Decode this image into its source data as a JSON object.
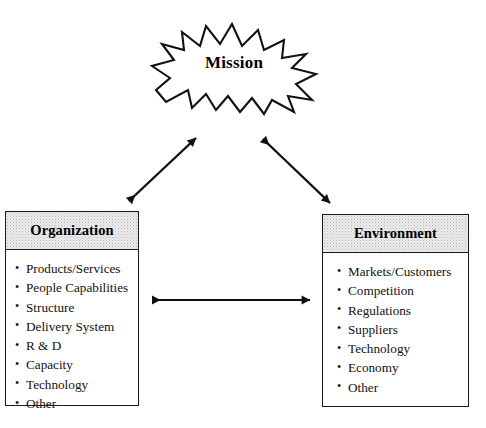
{
  "diagram": {
    "background_color": "#ffffff",
    "line_color": "#1a1a1a",
    "header_fill": "#ececec",
    "center_node": {
      "label": "Mission",
      "shape": "starburst"
    },
    "nodes": [
      {
        "id": "organization",
        "header": "Organization",
        "items": [
          "Products/Services",
          "People Capabilities",
          "Structure",
          "Delivery System",
          "R & D",
          "Capacity",
          "Technology",
          "Other"
        ]
      },
      {
        "id": "environment",
        "header": "Environment",
        "items": [
          "Markets/Customers",
          "Competition",
          "Regulations",
          "Suppliers",
          "Technology",
          "Economy",
          "Other"
        ]
      }
    ],
    "connectors": [
      {
        "id": "organization-mission",
        "name": "arrow-organization-mission",
        "style": "double-headed",
        "from": "organization",
        "to": "mission"
      },
      {
        "id": "mission-environment",
        "name": "arrow-mission-environment",
        "style": "double-headed",
        "from": "mission",
        "to": "environment"
      },
      {
        "id": "organization-environment",
        "name": "arrow-organization-environment",
        "style": "double-headed",
        "from": "organization",
        "to": "environment"
      }
    ]
  }
}
